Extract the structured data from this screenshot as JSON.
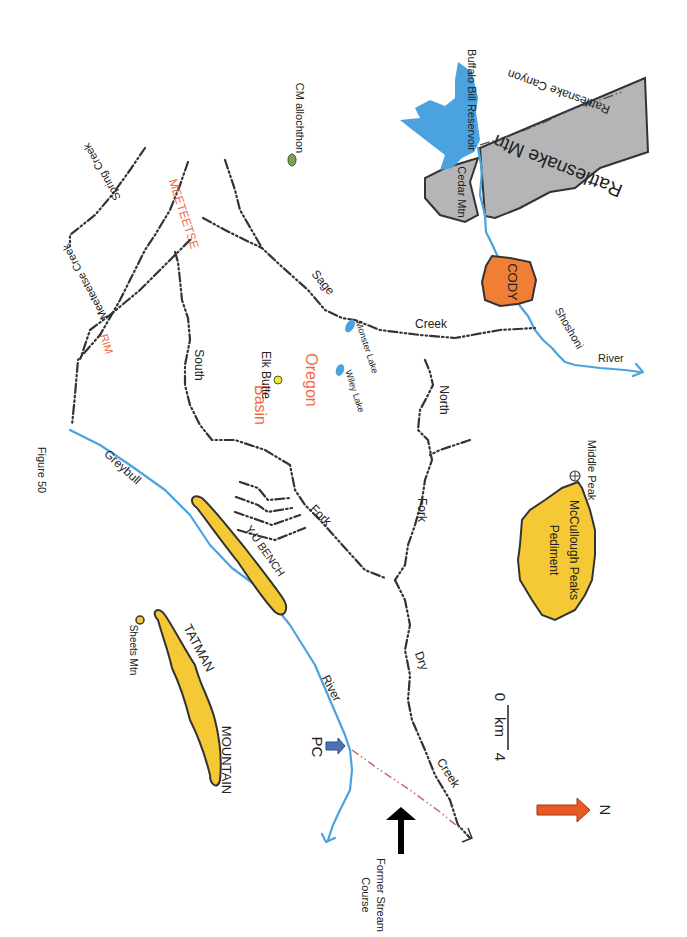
{
  "figure_caption": "Figure 50",
  "orientation": {
    "north_arrow_label": "N",
    "north_arrow_color": "#e85a22"
  },
  "scale_bar": {
    "start": "0",
    "unit": "km",
    "end": "4"
  },
  "features": {
    "rattlesnake_mtn": "Rattlesnake Mtn",
    "rattlesnake_canyon": "Rattlesnake Canyon",
    "cedar_mtn": "Cedar Mtn",
    "buffalo_bill_reservoir": "Buffalo Bill Reservoir",
    "cody": "CODY",
    "shoshoni": "Shoshoni",
    "shoshoni_river": "River",
    "cm_allochthon": "CM allochthon",
    "spring_creek": "Spring Creek",
    "meeteetse_rim_top": "MEETEETSE",
    "meeteetse_creek": "Meeteetse Creek",
    "rim": "RIM",
    "sage": "Sage",
    "sage_creek": "Creek",
    "monster_lake": "Monster Lake",
    "wiley_lake": "Wiley Lake",
    "oregon": "Oregon",
    "basin": "Basin",
    "elk_butte": "Elk Butte",
    "south": "South",
    "south_fork": "Fork",
    "north": "North",
    "north_fork": "Fork",
    "dry": "Dry",
    "dry_creek": "Creek",
    "greybull": "Greybull",
    "greybull_river": "River",
    "yu_bench": "Y-U BENCH",
    "tatman": "TATMAN",
    "mountain": "MOUNTAIN",
    "sheets_mtn": "Sheets Mtn",
    "pc": "PC",
    "former_stream_1": "Former Stream",
    "former_stream_2": "Course",
    "middle_peak": "Middle Peak",
    "mccullough_1": "McCullough Peaks",
    "mccullough_2": "Pediment"
  },
  "colors": {
    "water": "#4aa3df",
    "upland_yellow": "#f5c935",
    "mountain_gray": "#b5b5b7",
    "town_orange": "#f07f35",
    "label_orange": "#ef6a45",
    "allochthon_green": "#7aa34a",
    "former_course": "#c9677a",
    "pc_arrow": "#4a74b4"
  }
}
